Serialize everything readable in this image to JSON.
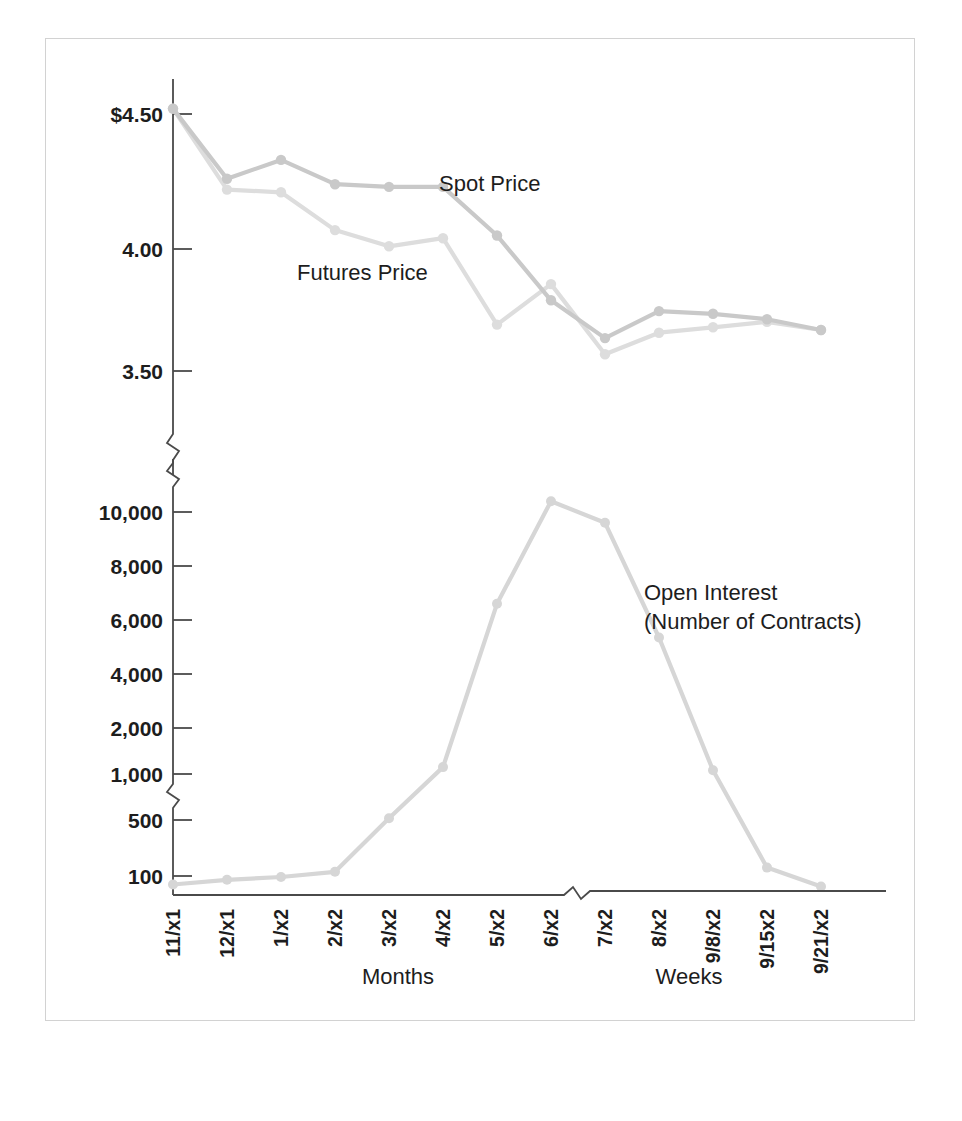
{
  "figure": {
    "background": "#ffffff",
    "frame_color": "#d2d2d2"
  },
  "labels": {
    "spot_price": "Spot Price",
    "futures_price": "Futures Price",
    "open_interest_line1": "Open Interest",
    "open_interest_line2": "(Number of Contracts)",
    "months_axis": "Months",
    "weeks_axis": "Weeks"
  },
  "colors": {
    "spot": "#c9c9c9",
    "futures": "#dddddd",
    "open_interest": "#d6d6d6",
    "axis": "#4a4a4a",
    "text": "#1d1d1d"
  },
  "chart_data": {
    "type": "line",
    "title": "",
    "xlabel": "Months / Weeks",
    "ylabel": "",
    "grid": false,
    "legend": "inline-annotation",
    "categories": [
      "11/x1",
      "12/x1",
      "1/x2",
      "2/x2",
      "3/x2",
      "4/x2",
      "5/x2",
      "6/x2",
      "7/x2",
      "8/x2",
      "9/8/x2",
      "9/15x2",
      "9/21/x2"
    ],
    "panels": [
      {
        "name": "price-panel",
        "ylabel": "",
        "yticks": [
          4.5,
          4.0,
          3.5
        ],
        "ytick_labels": [
          "$4.50",
          "4.00",
          "3.50"
        ],
        "ylim": [
          3.38,
          4.6
        ],
        "axis_break_below": true,
        "series": [
          {
            "name": "Spot Price",
            "color": "#c9c9c9",
            "values": [
              4.52,
              4.26,
              4.33,
              4.24,
              4.23,
              4.23,
              4.05,
              3.81,
              3.67,
              3.77,
              3.76,
              3.74,
              3.7
            ]
          },
          {
            "name": "Futures Price",
            "color": "#dddddd",
            "values": [
              4.52,
              4.22,
              4.21,
              4.07,
              4.01,
              4.04,
              3.72,
              3.87,
              3.61,
              3.69,
              3.71,
              3.73,
              3.7
            ]
          }
        ]
      },
      {
        "name": "open-interest-panel",
        "ylabel": "Open Interest (Number of Contracts)",
        "yticks": [
          10000,
          8000,
          6000,
          4000,
          2000,
          1000,
          500,
          100
        ],
        "ytick_labels": [
          "10,000",
          "8,000",
          "6,000",
          "4,000",
          "2,000",
          "1,000",
          "500",
          "100"
        ],
        "axis_break_below_1000": true,
        "axis_break_above_10000": true,
        "series": [
          {
            "name": "Open Interest",
            "color": "#d6d6d6",
            "values": [
              55,
              80,
              95,
              130,
              520,
              1150,
              6600,
              10400,
              9600,
              5350,
              1080,
              160,
              45
            ]
          }
        ]
      }
    ]
  },
  "geometry": {
    "x_axis_break_note": "break between 8/x2 and 9/8/x2"
  }
}
